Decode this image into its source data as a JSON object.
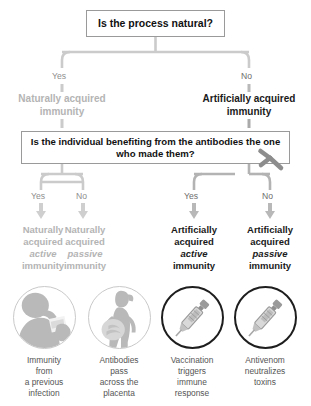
{
  "diagram": {
    "colors": {
      "grey_branch": "#b4b4b4",
      "dark_branch": "#1a1a1a",
      "connector_light": "#cfcfcf",
      "connector_dark": "#a8a8a8",
      "box_border": "#9a9a9a"
    }
  },
  "questions": {
    "q1": "Is the process natural?",
    "q2": "Is the individual benefiting from the antibodies the one who made them?"
  },
  "level1": {
    "yes_label": "Yes",
    "no_label": "No",
    "yes_outcome_line1": "Naturally acquired",
    "yes_outcome_line2": "immunity",
    "no_outcome_line1": "Artificially acquired",
    "no_outcome_line2": "immunity"
  },
  "level2": {
    "branches": [
      {
        "answer": "Yes"
      },
      {
        "answer": "No"
      },
      {
        "answer": "Yes"
      },
      {
        "answer": "No"
      }
    ]
  },
  "outcomes": [
    {
      "line1": "Naturally",
      "line2": "acquired",
      "line3": "active",
      "line4": "immunity",
      "style": "grey",
      "icon": "person-coughing-icon",
      "caption_line1": "Immunity",
      "caption_line2": "from",
      "caption_line3": "a previous",
      "caption_line4": "infection"
    },
    {
      "line1": "Naturally",
      "line2": "acquired",
      "line3": "passive",
      "line4": "immunity",
      "style": "grey",
      "icon": "pregnant-woman-icon",
      "caption_line1": "Antibodies",
      "caption_line2": "pass",
      "caption_line3": "across the",
      "caption_line4": "placenta"
    },
    {
      "line1": "Artificially",
      "line2": "acquired",
      "line3": "active",
      "line4": "immunity",
      "style": "dark",
      "icon": "syringe-icon",
      "caption_line1": "Vaccination",
      "caption_line2": "triggers",
      "caption_line3": "immune",
      "caption_line4": "response"
    },
    {
      "line1": "Artificially",
      "line2": "acquired",
      "line3": "passive",
      "line4": "immunity",
      "style": "dark",
      "icon": "syringe-icon",
      "caption_line1": "Antivenom",
      "caption_line2": "neutralizes",
      "caption_line3": "toxins",
      "caption_line4": ""
    }
  ],
  "decor": {
    "antibody_icon": "antibody-y-icon"
  }
}
